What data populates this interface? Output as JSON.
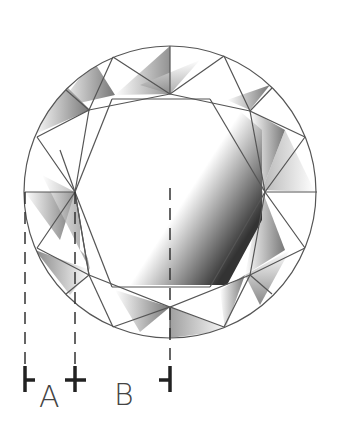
{
  "labels": {
    "a": "A",
    "b": "B"
  },
  "colors": {
    "stroke": "#555555",
    "marker": "#222222",
    "label": "#444444"
  }
}
